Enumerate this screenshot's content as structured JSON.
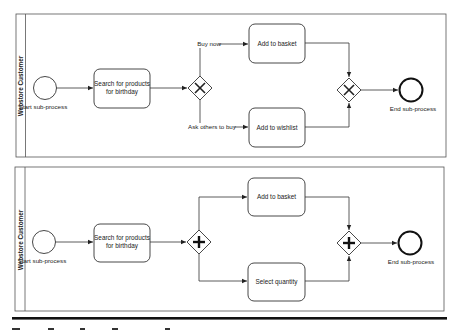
{
  "colors": {
    "stroke": "#3a3a3a",
    "background": "#ffffff",
    "text": "#222222",
    "rule": "#111111"
  },
  "diagram_top": {
    "lane_label": "Webstore Customer",
    "start_event": {
      "label": "Start sub-process"
    },
    "task_search": {
      "line1": "Search for products",
      "line2": "for birthday"
    },
    "split_gateway": {
      "type": "exclusive",
      "icon": "x-icon"
    },
    "branch_upper_label": "Buy now",
    "branch_lower_label": "Ask others to buy",
    "task_upper": {
      "label": "Add to basket"
    },
    "task_lower": {
      "label": "Add to wishlist"
    },
    "merge_gateway": {
      "type": "exclusive",
      "icon": "x-icon"
    },
    "end_event": {
      "label": "End sub-process"
    }
  },
  "diagram_bottom": {
    "lane_label": "Webstore Customer",
    "start_event": {
      "label": "Start sub-process"
    },
    "task_search": {
      "line1": "Search for products",
      "line2": "for birthday"
    },
    "split_gateway": {
      "type": "parallel",
      "icon": "plus-icon"
    },
    "task_upper": {
      "label": "Add to basket"
    },
    "task_lower": {
      "label": "Select quantity"
    },
    "merge_gateway": {
      "type": "parallel",
      "icon": "plus-icon"
    },
    "end_event": {
      "label": "End sub-process"
    }
  }
}
